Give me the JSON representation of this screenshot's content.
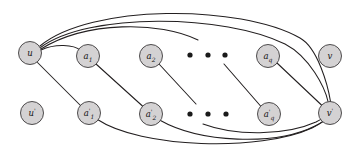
{
  "figure": {
    "background_color": "#ffffff",
    "width": 357,
    "height": 160
  },
  "style": {
    "node_fill": "#d4d2d3",
    "node_stroke": "#3c3a3b",
    "edge_color": "#231f20",
    "dot_color": "#1a1a1a",
    "label_color": "#141414",
    "node_radius": 11.5
  },
  "nodes": {
    "top_row": [
      {
        "id": "u",
        "label": "u",
        "sub": "",
        "prime": "",
        "x": 30,
        "y": 53,
        "isolated": false
      },
      {
        "id": "a1",
        "label": "a",
        "sub": "1",
        "prime": "",
        "x": 88,
        "y": 56,
        "isolated": false
      },
      {
        "id": "a2",
        "label": "a",
        "sub": "2",
        "prime": "",
        "x": 151,
        "y": 56,
        "isolated": false
      },
      {
        "id": "aq",
        "label": "a",
        "sub": "q",
        "prime": "",
        "x": 268,
        "y": 56,
        "isolated": false
      },
      {
        "id": "v",
        "label": "v",
        "sub": "",
        "prime": "",
        "x": 330,
        "y": 56,
        "isolated": true
      }
    ],
    "bottom_row": [
      {
        "id": "up",
        "label": "u",
        "sub": "",
        "prime": "'",
        "x": 32,
        "y": 113,
        "isolated": true
      },
      {
        "id": "a1p",
        "label": "a",
        "sub": "1",
        "prime": "'",
        "x": 89,
        "y": 113,
        "isolated": false
      },
      {
        "id": "a2p",
        "label": "a",
        "sub": "2",
        "prime": "'",
        "x": 151,
        "y": 114,
        "isolated": false
      },
      {
        "id": "aqp",
        "label": "a",
        "sub": "q",
        "prime": "'",
        "x": 269,
        "y": 114,
        "isolated": false
      },
      {
        "id": "vp",
        "label": "v",
        "sub": "",
        "prime": "'",
        "x": 330,
        "y": 113,
        "isolated": false
      }
    ]
  },
  "ellipses": [
    {
      "id": "top-ellipsis",
      "row": "top",
      "y": 55,
      "dots_x": [
        190,
        208,
        225
      ],
      "radius": 2.6
    },
    {
      "id": "bottom-ellipsis",
      "row": "bottom",
      "y": 114,
      "dots_x": [
        190,
        208,
        226
      ],
      "radius": 2.6
    }
  ],
  "edges": [
    {
      "id": "u-to-a1",
      "from": "u",
      "to": "a1",
      "kind": "arc",
      "path": "M 41.0 50.0 C 55 43.5, 74 44.5, 80.5 50.5"
    },
    {
      "id": "u-to-a1p",
      "from": "u",
      "to": "a1p",
      "kind": "straight",
      "path": "M 37.5 62.5 L 81.0 106.0"
    },
    {
      "id": "a1-to-a2p",
      "from": "a1",
      "to": "a2p",
      "kind": "straight",
      "path": "M 96.0 64.0 L 143.0 106.5"
    },
    {
      "id": "a2-to-dots",
      "from": "a2",
      "to": "mid",
      "kind": "straight",
      "path": "M 159.0 64.0 L 196.0 104.0"
    },
    {
      "id": "dots-to-aqp",
      "from": "mid",
      "to": "aqp",
      "kind": "straight",
      "path": "M 224.0 64.0 L 261.0 106.5"
    },
    {
      "id": "aq-to-vp",
      "from": "aq",
      "to": "vp",
      "kind": "straight",
      "path": "M 277.0 63.0 L 322.0 105.5"
    },
    {
      "id": "u-arc-outer",
      "from": "u",
      "to": "vp",
      "kind": "arc",
      "path": "M 40.0 46.0 C 90 4, 240 4, 300 38 C 318 48, 328 86, 330.5 101.5"
    },
    {
      "id": "u-arc-mid",
      "from": "u",
      "to": "vp",
      "kind": "arc",
      "path": "M 40.5 47.5 C 88 12, 225 14, 285 44 C 310 57, 325 88, 328.0 101.5"
    },
    {
      "id": "u-arc-inner",
      "from": "u",
      "to": "cut",
      "kind": "arc",
      "path": "M 41.0 49.0 C 86 21, 160 21, 198 40"
    },
    {
      "id": "a1p-arc",
      "from": "a1p",
      "to": "vp",
      "kind": "arc",
      "path": "M 97.5 119.5 C 140 148, 260 152, 312 128 C 322 123, 327 119, 329.0 116.0"
    },
    {
      "id": "a2p-arc",
      "from": "a2p",
      "to": "vp",
      "kind": "arc",
      "path": "M 159.5 120.0 C 200 143, 275 146, 315 126 C 323 122, 328 118, 330.0 114.5"
    },
    {
      "id": "mid-arc",
      "from": "mid",
      "to": "vp",
      "kind": "arc",
      "path": "M 203.0 124.0 C 235 136, 285 136, 316 122 C 324 118, 329 114, 331.0 112.0"
    }
  ]
}
